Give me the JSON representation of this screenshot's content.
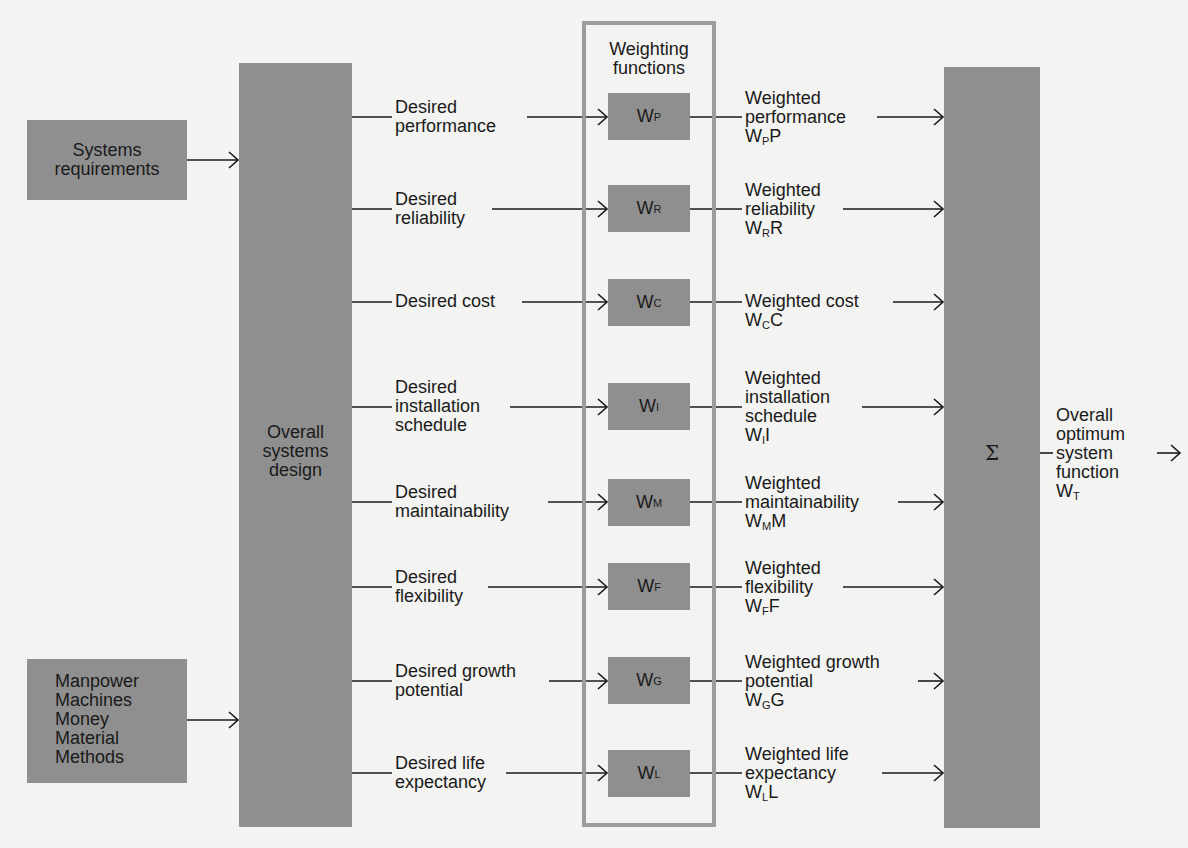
{
  "inputs": {
    "systems_requirements": [
      "Systems",
      "requirements"
    ],
    "resources": [
      "Manpower",
      "Machines",
      "Money",
      "Material",
      "Methods"
    ]
  },
  "overall_design": [
    "Overall",
    "systems",
    "design"
  ],
  "weighting_frame_title": [
    "Weighting",
    "functions"
  ],
  "rows": [
    {
      "desired": [
        "Desired",
        "performance"
      ],
      "w": "W",
      "sub": "P",
      "weighted": [
        "Weighted",
        "performance"
      ],
      "product_sub": "P",
      "product_var": "P"
    },
    {
      "desired": [
        "Desired",
        "reliability"
      ],
      "w": "W",
      "sub": "R",
      "weighted": [
        "Weighted",
        "reliability"
      ],
      "product_sub": "R",
      "product_var": "R"
    },
    {
      "desired": [
        "Desired cost"
      ],
      "w": "W",
      "sub": "C",
      "weighted": [
        "Weighted cost"
      ],
      "product_sub": "C",
      "product_var": "C"
    },
    {
      "desired": [
        "Desired",
        "installation",
        "schedule"
      ],
      "w": "W",
      "sub": "I",
      "weighted": [
        "Weighted",
        "installation",
        "schedule"
      ],
      "product_sub": "I",
      "product_var": "I"
    },
    {
      "desired": [
        "Desired",
        "maintainability"
      ],
      "w": "W",
      "sub": "M",
      "weighted": [
        "Weighted",
        "maintainability"
      ],
      "product_sub": "M",
      "product_var": "M"
    },
    {
      "desired": [
        "Desired",
        "flexibility"
      ],
      "w": "W",
      "sub": "F",
      "weighted": [
        "Weighted",
        "flexibility"
      ],
      "product_sub": "F",
      "product_var": "F"
    },
    {
      "desired": [
        "Desired growth",
        "potential"
      ],
      "w": "W",
      "sub": "G",
      "weighted": [
        "Weighted growth",
        "potential"
      ],
      "product_sub": "G",
      "product_var": "G"
    },
    {
      "desired": [
        "Desired life",
        "expectancy"
      ],
      "w": "W",
      "sub": "L",
      "weighted": [
        "Weighted life",
        "expectancy"
      ],
      "product_sub": "L",
      "product_var": "L"
    }
  ],
  "summation": {
    "symbol": "Σ"
  },
  "output": {
    "lines": [
      "Overall",
      "optimum",
      "system",
      "function"
    ],
    "w": "W",
    "sub": "T"
  },
  "colors": {
    "block": "#8f8f8f",
    "frame": "#9c9c9c",
    "background": "#f3f3f1",
    "line": "#1a1a1a"
  }
}
